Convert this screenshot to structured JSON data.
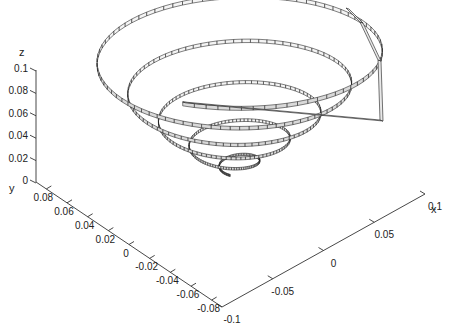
{
  "chart_data": {
    "type": "line",
    "subtype": "3d-ribbon-spiral",
    "title": "",
    "axes": {
      "x": {
        "label": "x",
        "ticks": [
          "-0.1",
          "-0.05",
          "0",
          "0.05",
          "0.1"
        ],
        "tick_values": [
          -0.1,
          -0.05,
          0,
          0.05,
          0.1
        ],
        "range": [
          -0.1,
          0.1
        ]
      },
      "y": {
        "label": "y",
        "ticks": [
          "0.08",
          "0.06",
          "0.04",
          "0.02",
          "0",
          "-0.02",
          "-0.04",
          "-0.06",
          "-0.08"
        ],
        "tick_values": [
          0.08,
          0.06,
          0.04,
          0.02,
          0,
          -0.02,
          -0.04,
          -0.06,
          -0.08
        ],
        "range": [
          -0.09,
          0.09
        ]
      },
      "z": {
        "label": "z",
        "ticks": [
          "0",
          "0.02",
          "0.04",
          "0.06",
          "0.08",
          "0.1"
        ],
        "tick_values": [
          0,
          0.02,
          0.04,
          0.06,
          0.08,
          0.1
        ],
        "range": [
          0,
          0.1
        ]
      }
    },
    "series": [
      {
        "name": "spiral ribbon",
        "turns": 5,
        "radius_start": 0.0,
        "radius_end": 0.1,
        "z_start": 0.0,
        "z_end": 0.1
      }
    ],
    "grid": false,
    "legend": null
  }
}
